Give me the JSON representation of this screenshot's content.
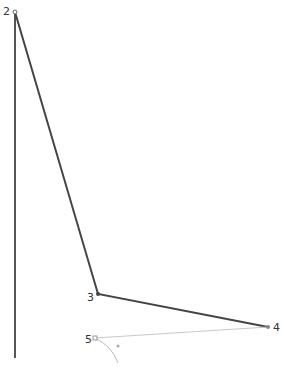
{
  "canvas": {
    "width": 288,
    "height": 367,
    "background": "#ffffff"
  },
  "colors": {
    "main_line": "#444444",
    "light_line": "#bbbbbb",
    "handle": "#888888"
  },
  "points": [
    {
      "id": "2",
      "label": "2",
      "x": 15,
      "y": 12
    },
    {
      "id": "3",
      "label": "3",
      "x": 98,
      "y": 294
    },
    {
      "id": "4",
      "label": "4",
      "x": 268,
      "y": 327
    },
    {
      "id": "5",
      "label": "5",
      "x": 95,
      "y": 338
    }
  ],
  "labels": {
    "p2": "2",
    "p3": "3",
    "p4": "4",
    "p5": "5"
  }
}
